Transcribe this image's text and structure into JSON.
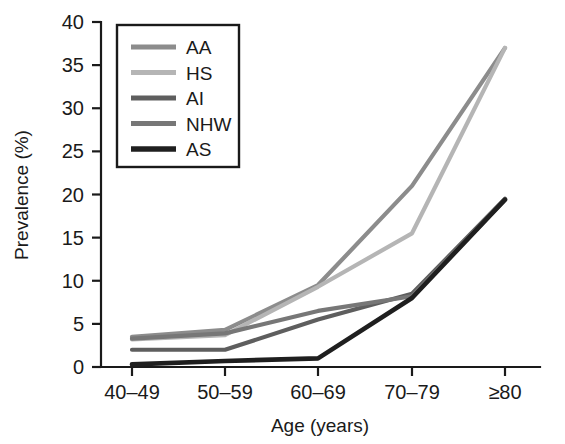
{
  "chart_data": {
    "type": "line",
    "title": "",
    "xlabel": "Age (years)",
    "ylabel": "Prevalence (%)",
    "categories": [
      "40–49",
      "50–59",
      "60–69",
      "70–79",
      "≥80"
    ],
    "ylim": [
      0,
      40
    ],
    "yticks": [
      0,
      5,
      10,
      15,
      20,
      25,
      30,
      35,
      40
    ],
    "ytick_labels": [
      "0",
      "5",
      "10",
      "15",
      "20",
      "25",
      "30",
      "35",
      "40"
    ],
    "grid": false,
    "legend_position": "upper-left-inside",
    "series": [
      {
        "name": "AA",
        "values": [
          3.5,
          4.3,
          9.5,
          21.0,
          37.0
        ],
        "color": "#8c8c8c"
      },
      {
        "name": "HS",
        "values": [
          3.2,
          3.7,
          9.3,
          15.5,
          37.0
        ],
        "color": "#b5b5b5"
      },
      {
        "name": "AI",
        "values": [
          2.0,
          2.0,
          5.5,
          8.5,
          19.5
        ],
        "color": "#5e5e5e"
      },
      {
        "name": "NHW",
        "values": [
          3.3,
          3.9,
          6.5,
          8.2,
          19.4
        ],
        "color": "#777777"
      },
      {
        "name": "AS",
        "values": [
          0.3,
          0.7,
          1.0,
          8.0,
          19.4
        ],
        "color": "#1f1f1f"
      }
    ]
  },
  "legend": {
    "entries": [
      {
        "label": "AA"
      },
      {
        "label": "HS"
      },
      {
        "label": "AI"
      },
      {
        "label": "NHW"
      },
      {
        "label": "AS"
      }
    ]
  },
  "axes": {
    "y_title": "Prevalence (%)",
    "x_title": "Age (years)"
  }
}
